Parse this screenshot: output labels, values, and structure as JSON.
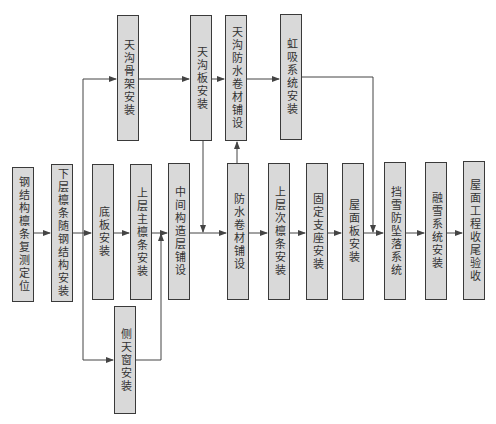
{
  "diagram": {
    "type": "flowchart",
    "nodes": {
      "n1": "钢结构檩条复测定位",
      "n2": "下层檩条随钢结构安装",
      "n3": "底板安装",
      "n4": "上层主檩条安装",
      "n5": "中间构造层铺设",
      "n6": "防水卷材铺设",
      "n7": "上层次檩条安装",
      "n8": "固定支座安装",
      "n9": "屋面板安装",
      "n10": "挡雪防坠落系统",
      "n11": "融雪系统安装",
      "n12": "屋面工程收尾验收",
      "t1": "天沟骨架安装",
      "t2": "天沟板安装",
      "t3": "天沟防水卷材铺设",
      "t4": "虹吸系统安装",
      "b1": "侧天窗安装"
    },
    "edges": [
      [
        "n1",
        "n2"
      ],
      [
        "n2",
        "n3"
      ],
      [
        "n3",
        "n4"
      ],
      [
        "n4",
        "n5"
      ],
      [
        "n5",
        "n6"
      ],
      [
        "n6",
        "n7"
      ],
      [
        "n7",
        "n8"
      ],
      [
        "n8",
        "n9"
      ],
      [
        "n9",
        "n10"
      ],
      [
        "n10",
        "n11"
      ],
      [
        "n11",
        "n12"
      ],
      [
        "n2",
        "t1"
      ],
      [
        "t1",
        "t2"
      ],
      [
        "t2",
        "t3"
      ],
      [
        "t3",
        "t4"
      ],
      [
        "t2",
        "n6"
      ],
      [
        "n6",
        "t3"
      ],
      [
        "t4",
        "n10"
      ],
      [
        "n2",
        "b1"
      ],
      [
        "b1",
        "n5"
      ]
    ],
    "colors": {
      "box_fill": "#d9d9d9",
      "box_border": "#3a3a3a",
      "line": "#444444"
    }
  }
}
